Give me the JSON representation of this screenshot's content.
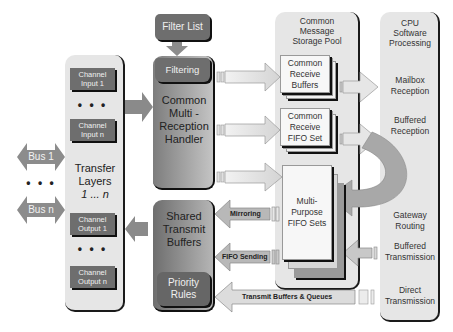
{
  "filter_list": {
    "label": "Filter List"
  },
  "transfer_layers": {
    "title_line1": "Transfer",
    "title_line2": "Layers",
    "title_line3": "1 ... n",
    "channels_in": [
      {
        "line1": "Channel",
        "line2": "Input 1"
      },
      {
        "line1": "Channel",
        "line2": "Input n"
      }
    ],
    "channels_out": [
      {
        "line1": "Channel",
        "line2": "Output 1"
      },
      {
        "line1": "Channel",
        "line2": "Output n"
      }
    ],
    "ellipsis": "• • •"
  },
  "buses": [
    {
      "label": "Bus 1"
    },
    {
      "label": "Bus n"
    }
  ],
  "bus_ellipsis": "• • •",
  "reception_handler": {
    "filtering": "Filtering",
    "line1": "Common",
    "line2": "Multi -",
    "line3": "Reception",
    "line4": "Handler"
  },
  "transmit": {
    "line1": "Shared",
    "line2": "Transmit",
    "line3": "Buffers",
    "priority_line1": "Priority",
    "priority_line2": "Rules"
  },
  "storage_pool": {
    "title_line1": "Common",
    "title_line2": "Message",
    "title_line3": "Storage Pool",
    "receive_buffers": {
      "line1": "Common",
      "line2": "Receive",
      "line3": "Buffers"
    },
    "receive_fifo": {
      "line1": "Common",
      "line2": "Receive",
      "line3": "FIFO Set"
    },
    "multi_fifo": {
      "line1": "Multi-",
      "line2": "Purpose",
      "line3": "FIFO Sets"
    }
  },
  "cpu": {
    "title_line1": "CPU",
    "title_line2": "Software",
    "title_line3": "Processing",
    "items": [
      {
        "line1": "Mailbox",
        "line2": "Reception"
      },
      {
        "line1": "Buffered",
        "line2": "Reception"
      },
      {
        "line1": "Gateway",
        "line2": "Routing"
      },
      {
        "line1": "Buffered",
        "line2": "Transmission"
      },
      {
        "line1": "Direct",
        "line2": "Transmission"
      }
    ]
  },
  "arrows": {
    "mirroring": "Mirroring",
    "fifo_sending": "FIFO Sending",
    "transmit_buffers_queues": "Transmit Buffers & Queues"
  },
  "colors": {
    "dark_box": "#6e6e6e",
    "panel_bg": "#e6e6e6",
    "arrow_gray": "#8a8a8a",
    "arrow_light": "#e8e8e8"
  }
}
